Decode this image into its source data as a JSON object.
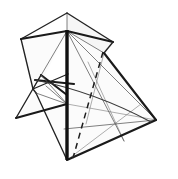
{
  "figure": {
    "canvas": {
      "width": 178,
      "height": 179,
      "background": "#ffffff"
    },
    "colors": {
      "background": "#ffffff",
      "heavy_edge": "#1a1a1a",
      "medium_edge": "#222222",
      "thin_edge": "#555555",
      "hair_edge": "#777777",
      "spine": "#111111",
      "fold_dashed": "#1e1e1e",
      "arc": "#3a3a3a",
      "panel_light": "#fbfbfb",
      "panel_mid": "#f6f6f6"
    },
    "vertices": {
      "apex_top": [
        67,
        13
      ],
      "hub": [
        67,
        31
      ],
      "left_wing_outer": [
        21,
        39
      ],
      "left_wing_lower": [
        33,
        89
      ],
      "right_wing_outer": [
        113,
        42
      ],
      "right_wing_mid": [
        104,
        53
      ],
      "beak_tip": [
        16,
        118
      ],
      "beak_upper": [
        41,
        75
      ],
      "beak_knot": [
        62,
        94
      ],
      "body_waist": [
        67,
        104
      ],
      "bottom_point": [
        67,
        160
      ],
      "right_point": [
        156,
        120
      ],
      "right_lower_inner": [
        124,
        140
      ],
      "mid_left_edge": [
        36,
        80
      ]
    },
    "panels": [
      {
        "name": "left-wing-panel",
        "fill": "#fbfbfb",
        "points": "21,39 67,31 33,89 36,93"
      },
      {
        "name": "upper-center-panel",
        "fill": "#f6f6f6",
        "points": "67,13 113,42 104,53 67,31"
      },
      {
        "name": "body-panel",
        "fill": "#f9f9f9",
        "points": "67,31 104,53 156,120 67,160"
      },
      {
        "name": "lower-left-panel",
        "fill": "#fbfbfb",
        "points": "67,104 67,160 36,93 16,118"
      }
    ],
    "solid_edges": [
      {
        "name": "apex-to-left-wing",
        "points": "67,13 21,39",
        "weight": "medium"
      },
      {
        "name": "apex-to-right-wing",
        "points": "67,13 113,42",
        "weight": "medium"
      },
      {
        "name": "apex-vertical-thin",
        "points": "67,13 67,31",
        "weight": "thin"
      },
      {
        "name": "left-wing-outer-edge",
        "points": "21,39 33,89",
        "weight": "medium"
      },
      {
        "name": "left-wing-to-hub",
        "points": "21,39 67,31",
        "weight": "heavy"
      },
      {
        "name": "right-wing-to-hub",
        "points": "113,42 67,31",
        "weight": "heavy"
      },
      {
        "name": "right-wing-inner-fold",
        "points": "113,42 104,53",
        "weight": "medium"
      },
      {
        "name": "right-long-edge",
        "points": "104,53 156,120",
        "weight": "heavy"
      },
      {
        "name": "right-to-bottom-edge",
        "points": "156,120 67,160",
        "weight": "heavy"
      },
      {
        "name": "hub-fan-left",
        "points": "67,31 33,89",
        "weight": "thin"
      },
      {
        "name": "hub-fan-center-left",
        "points": "67,31 41,75",
        "weight": "medium"
      },
      {
        "name": "hub-fan-right-a",
        "points": "67,31 104,53",
        "weight": "thin"
      },
      {
        "name": "hub-fan-right-b",
        "points": "67,31 124,140",
        "weight": "thin"
      },
      {
        "name": "hub-fan-right-c",
        "points": "67,31 156,120",
        "weight": "thin"
      },
      {
        "name": "beak-upper-edge",
        "points": "16,118 41,75",
        "weight": "medium"
      },
      {
        "name": "beak-lower-edge",
        "points": "16,118 67,104",
        "weight": "heavy"
      },
      {
        "name": "beak-spine-upper",
        "points": "41,75 67,94",
        "weight": "heavy"
      },
      {
        "name": "beak-cross-a",
        "points": "36,80 72,84",
        "weight": "heavy"
      },
      {
        "name": "beak-cross-b",
        "points": "33,89 67,75",
        "weight": "medium"
      },
      {
        "name": "beak-knot-to-waist",
        "points": "41,75 67,104",
        "weight": "thin"
      },
      {
        "name": "beak-lower-short",
        "points": "36,93 67,104",
        "weight": "thin"
      },
      {
        "name": "waist-to-bottom-left",
        "points": "36,93 67,160",
        "weight": "medium"
      },
      {
        "name": "left-lower-panel-edge",
        "points": "33,89 36,93",
        "weight": "medium"
      },
      {
        "name": "horizontal-mid-line",
        "points": "64,129 156,120",
        "weight": "thin"
      },
      {
        "name": "inner-thin-a",
        "points": "67,104 156,120",
        "weight": "hair"
      },
      {
        "name": "inner-thin-b",
        "points": "88,62 124,140",
        "weight": "hair"
      },
      {
        "name": "inner-thin-c",
        "points": "67,160 140,105",
        "weight": "hair"
      },
      {
        "name": "inner-thin-d",
        "points": "104,53 88,120",
        "weight": "hair"
      }
    ],
    "spine": {
      "name": "center-spine",
      "points": "67,31 67,160"
    },
    "fold_lines": [
      {
        "name": "mountain-fold-dashed",
        "points": "103,52 73,158"
      }
    ],
    "arcs": [
      {
        "name": "sweep-arc",
        "path": "M 36,80 Q 95,93 150,122"
      }
    ]
  }
}
